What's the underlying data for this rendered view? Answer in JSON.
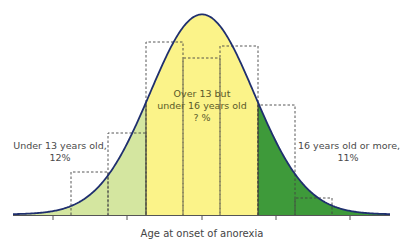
{
  "chart_data": {
    "type": "area",
    "title": "",
    "xlabel": "Age at onset of anorexia",
    "ylabel": "",
    "grid": false,
    "distribution": "normal",
    "curve": {
      "mean_px": 202,
      "peak_y_px": 15,
      "sigma_px": 52,
      "baseline_y_px": 215,
      "x_start_px": 13,
      "x_end_px": 390,
      "stroke": "#1f2f6e"
    },
    "ticks_px": [
      53,
      127,
      202,
      276,
      350
    ],
    "regions": [
      {
        "name": "Under 13 years old",
        "label_line1": "Under 13 years old,",
        "label_line2": "12%",
        "value": 12,
        "x_from_px": 13,
        "x_to_px": 146,
        "color": "#d4e6a0"
      },
      {
        "name": "Over 13 but under 16 years old",
        "label_line1": "Over 13 but",
        "label_line2": "under 16 years old",
        "label_line3": "? %",
        "value": null,
        "x_from_px": 146,
        "x_to_px": 258,
        "color": "#fbf389"
      },
      {
        "name": "16 years old or more",
        "label_line1": "16 years old or more,",
        "label_line2": "11%",
        "value": 11,
        "x_from_px": 258,
        "x_to_px": 390,
        "color": "#3e9a3a"
      }
    ],
    "histogram_bars": [
      {
        "x0": 71,
        "x1": 108,
        "top": 172
      },
      {
        "x0": 108,
        "x1": 146,
        "top": 133
      },
      {
        "x0": 146,
        "x1": 183,
        "top": 42
      },
      {
        "x0": 183,
        "x1": 220,
        "top": 58
      },
      {
        "x0": 220,
        "x1": 258,
        "top": 46
      },
      {
        "x0": 258,
        "x1": 295,
        "top": 105
      },
      {
        "x0": 295,
        "x1": 332,
        "top": 198
      }
    ]
  },
  "labels": {
    "under": {
      "line1": "Under 13 years old,",
      "line2": "12%"
    },
    "mid": {
      "line1": "Over 13 but",
      "line2": "under 16 years old",
      "line3": "? %"
    },
    "over": {
      "line1": "16 years old or more,",
      "line2": "11%"
    },
    "xlabel": "Age at onset of anorexia"
  }
}
